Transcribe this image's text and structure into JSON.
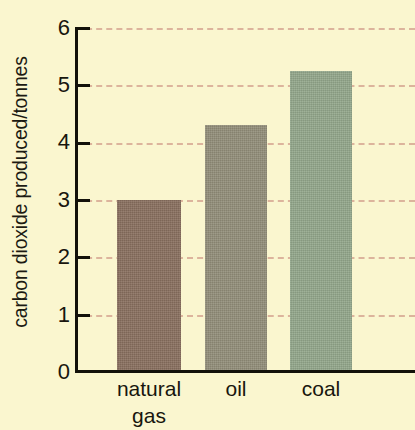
{
  "chart_data": {
    "type": "bar",
    "title": "",
    "subtitle": "",
    "xlabel": "",
    "ylabel": "carbon dioxide produced/tonnes",
    "categories": [
      "natural\ngas",
      "oil",
      "coal"
    ],
    "category_plain": [
      "natural gas",
      "oil",
      "coal"
    ],
    "values": [
      3.0,
      4.3,
      5.25
    ],
    "ylim": [
      0,
      6
    ],
    "yticks": [
      0,
      1,
      2,
      3,
      4,
      5,
      6
    ],
    "ytick_labels": [
      "0",
      "1",
      "2",
      "3",
      "4",
      "5",
      "6"
    ],
    "grid": true,
    "grid_axis": "y",
    "grid_style": "dashed",
    "legend": false,
    "legend_position": "none",
    "bar_colors": [
      "#8a7160",
      "#938f7a",
      "#94a88c"
    ],
    "colors": {
      "background": "#faf6cf",
      "axis": "#13110a",
      "gridline": "#dcb49c",
      "text": "#18160e"
    }
  }
}
